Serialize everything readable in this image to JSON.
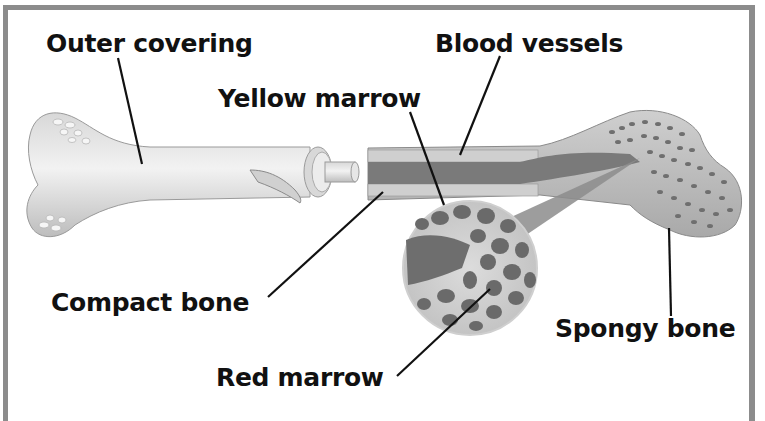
{
  "diagram": {
    "labels": {
      "outer_covering": "Outer covering",
      "blood_vessels": "Blood vessels",
      "yellow_marrow": "Yellow marrow",
      "compact_bone": "Compact bone",
      "red_marrow": "Red marrow",
      "spongy_bone": "Spongy bone"
    },
    "colors": {
      "frame": "#8c8c8c",
      "bone_light": "#e4e4e4",
      "bone_mid": "#c8c8c8",
      "marrow_dark": "#7a7a7a",
      "leader_line": "#111111"
    }
  }
}
